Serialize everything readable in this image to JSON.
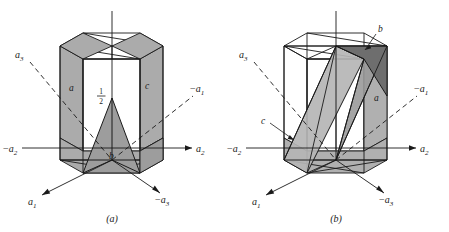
{
  "figure": {
    "type": "crystallography-diagram",
    "colors": {
      "stroke": "#1a1a1a",
      "shade_light": "#b3b3b3",
      "shade_mid": "#9a9a9a",
      "shade_dark": "#6e6e6e",
      "background": "#ffffff"
    }
  },
  "panel_a": {
    "caption": "(a)",
    "axes": [
      {
        "name": "a3-dashed",
        "label_base": "a",
        "label_sub": "3",
        "label_sign": "",
        "style": "dashed"
      },
      {
        "name": "neg-a1-dashed",
        "label_base": "a",
        "label_sub": "1",
        "label_sign": "−",
        "style": "dashed"
      },
      {
        "name": "neg-a2-solid",
        "label_base": "a",
        "label_sub": "2",
        "label_sign": "−",
        "style": "solid"
      },
      {
        "name": "a2-solid",
        "label_base": "a",
        "label_sub": "2",
        "label_sign": "",
        "style": "solid"
      },
      {
        "name": "a1-solid",
        "label_base": "a",
        "label_sub": "1",
        "label_sign": "",
        "style": "solid"
      },
      {
        "name": "neg-a3-solid",
        "label_base": "a",
        "label_sub": "3",
        "label_sign": "−",
        "style": "solid"
      }
    ],
    "intercepts": [
      {
        "name": "intercept-a",
        "label": "a"
      },
      {
        "name": "intercept-c",
        "label": "c"
      },
      {
        "name": "intercept-b",
        "label": "b"
      }
    ],
    "fraction": {
      "numerator": "1",
      "denominator": "2"
    }
  },
  "panel_b": {
    "caption": "(b)",
    "axes": [
      {
        "name": "a3-dashed",
        "label_base": "a",
        "label_sub": "3",
        "label_sign": "",
        "style": "dashed"
      },
      {
        "name": "neg-a1-dashed",
        "label_base": "a",
        "label_sub": "1",
        "label_sign": "−",
        "style": "dashed"
      },
      {
        "name": "neg-a2-solid",
        "label_base": "a",
        "label_sub": "2",
        "label_sign": "−",
        "style": "solid"
      },
      {
        "name": "a2-solid",
        "label_base": "a",
        "label_sub": "2",
        "label_sign": "",
        "style": "solid"
      },
      {
        "name": "a1-solid",
        "label_base": "a",
        "label_sub": "1",
        "label_sign": "",
        "style": "solid"
      },
      {
        "name": "neg-a3-solid",
        "label_base": "a",
        "label_sub": "3",
        "label_sign": "−",
        "style": "solid"
      }
    ],
    "intercepts": [
      {
        "name": "intercept-b",
        "label": "b"
      },
      {
        "name": "intercept-a",
        "label": "a"
      },
      {
        "name": "intercept-c",
        "label": "c"
      }
    ]
  }
}
